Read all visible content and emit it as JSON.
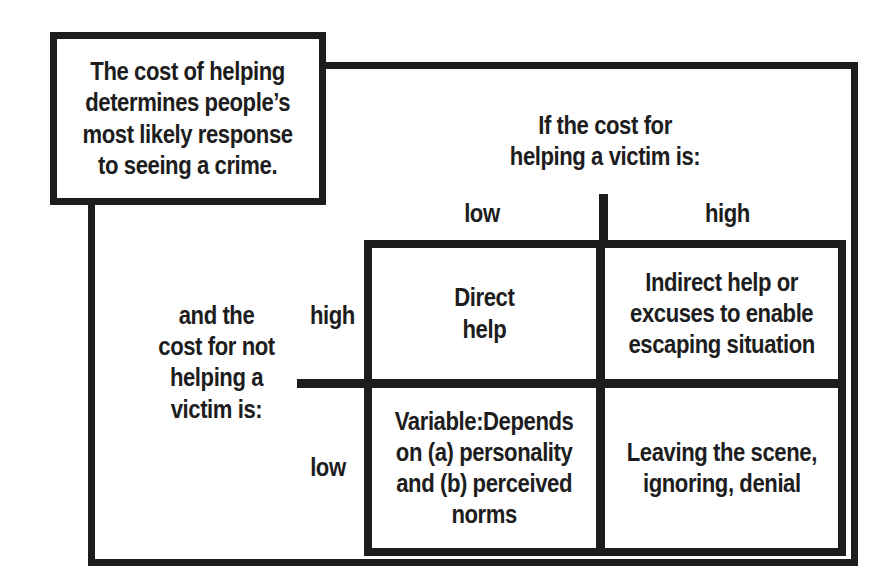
{
  "colors": {
    "ink": "#1d1d1d",
    "paper": "#ffffff"
  },
  "callout": {
    "lines": [
      "The cost of helping",
      "determines people’s",
      "most likely response",
      "to seeing a crime."
    ]
  },
  "col_axis": {
    "header": [
      "If the cost for",
      "helping a victim is:"
    ],
    "labels": {
      "low": "low",
      "high": "high"
    }
  },
  "row_axis": {
    "header": [
      "and the",
      "cost for not",
      "helping a",
      "victim is:"
    ],
    "labels": {
      "high": "high",
      "low": "low"
    }
  },
  "matrix": {
    "top_left": [
      "Direct",
      "help"
    ],
    "top_right": [
      "Indirect help or",
      "excuses to enable",
      "escaping situation"
    ],
    "bottom_left": [
      "Variable:Depends",
      "on (a) personality",
      "and (b) perceived",
      "norms"
    ],
    "bottom_right": [
      "Leaving the scene,",
      "ignoring, denial"
    ]
  }
}
